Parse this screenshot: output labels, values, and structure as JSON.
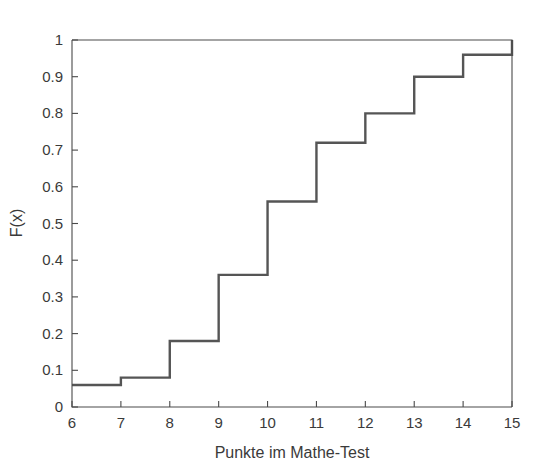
{
  "chart_data": {
    "type": "line",
    "subtype": "step-ecdf",
    "title": "",
    "xlabel": "Punkte im Mathe-Test",
    "ylabel": "F(x)",
    "xlim": [
      6,
      15
    ],
    "ylim": [
      0,
      1
    ],
    "grid": false,
    "legend": null,
    "x_ticks": [
      6,
      7,
      8,
      9,
      10,
      11,
      12,
      13,
      14,
      15
    ],
    "x_tick_labels": [
      "6",
      "7",
      "8",
      "9",
      "10",
      "11",
      "12",
      "13",
      "14",
      "15"
    ],
    "y_ticks": [
      0,
      0.1,
      0.2,
      0.3,
      0.4,
      0.5,
      0.6,
      0.7,
      0.8,
      0.9,
      1
    ],
    "y_tick_labels": [
      "0",
      "0.1",
      "0.2",
      "0.3",
      "0.4",
      "0.5",
      "0.6",
      "0.7",
      "0.8",
      "0.9",
      "1"
    ],
    "x": [
      6,
      7,
      8,
      9,
      10,
      11,
      12,
      13,
      14,
      15
    ],
    "values": [
      0.06,
      0.08,
      0.18,
      0.36,
      0.56,
      0.72,
      0.8,
      0.9,
      0.96,
      1.0
    ],
    "series": [
      {
        "name": "F(x)",
        "color": "#555555",
        "points": [
          {
            "x": 6,
            "y": 0.06
          },
          {
            "x": 7,
            "y": 0.08
          },
          {
            "x": 8,
            "y": 0.18
          },
          {
            "x": 9,
            "y": 0.36
          },
          {
            "x": 10,
            "y": 0.56
          },
          {
            "x": 11,
            "y": 0.72
          },
          {
            "x": 12,
            "y": 0.8
          },
          {
            "x": 13,
            "y": 0.9
          },
          {
            "x": 14,
            "y": 0.96
          },
          {
            "x": 15,
            "y": 1.0
          }
        ]
      }
    ],
    "colors": {
      "line": "#555555",
      "axis": "#4a4a4a",
      "text": "#3a3a3a",
      "background": "#ffffff"
    }
  }
}
